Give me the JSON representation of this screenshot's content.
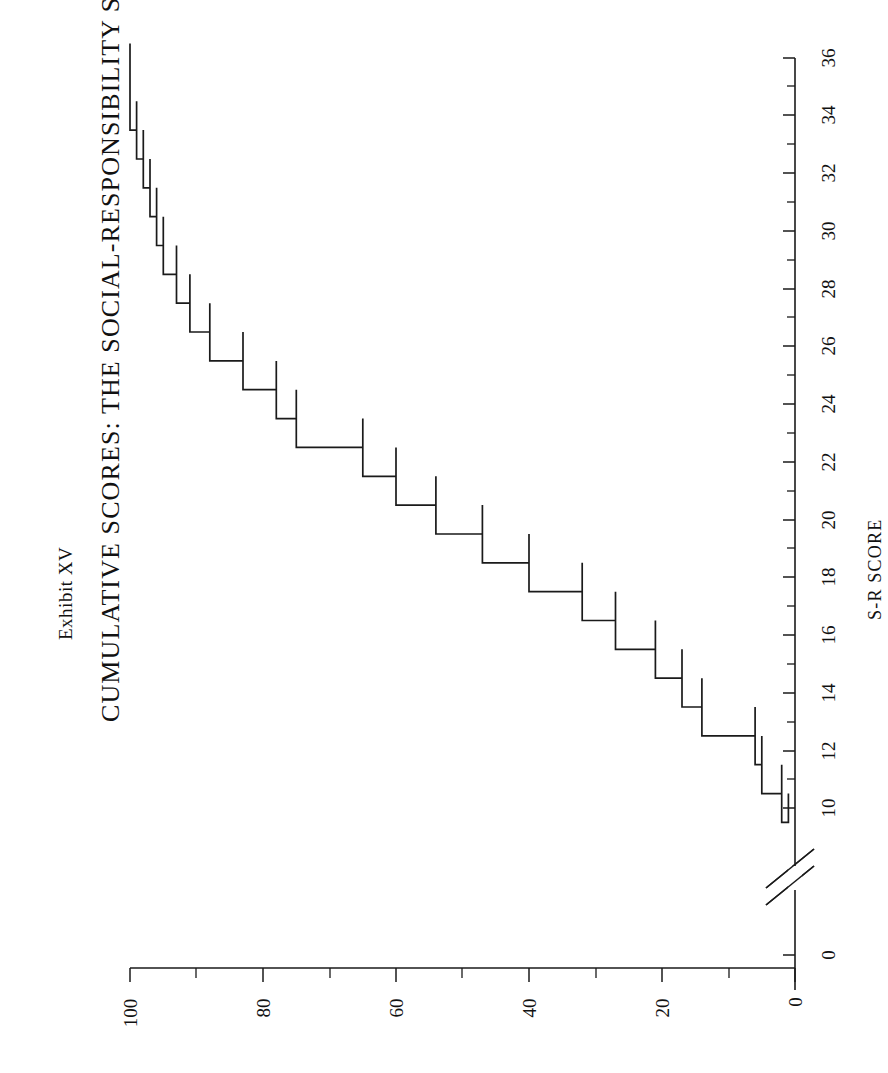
{
  "figure": {
    "exhibit_label": "Exhibit XV",
    "title": "CUMULATIVE SCORES:  THE SOCIAL-RESPONSIBILITY SCALE",
    "orientation": "rotated-90-ccw",
    "background_color": "#ffffff",
    "ink_color": "#1a1a1a"
  },
  "chart_data": {
    "type": "line",
    "subtype": "cumulative-step",
    "title": "CUMULATIVE SCORES:  THE SOCIAL-RESPONSIBILITY SCALE",
    "subtitle": "Exhibit XV",
    "xlabel": "S-R SCORE",
    "ylabel": "",
    "x": [
      10,
      11,
      12,
      13,
      14,
      15,
      16,
      17,
      18,
      19,
      20,
      21,
      22,
      23,
      24,
      25,
      26,
      27,
      28,
      29,
      30,
      31,
      32,
      33,
      34,
      35,
      36
    ],
    "values": [
      1,
      2,
      5,
      6,
      14,
      17,
      21,
      27,
      32,
      40,
      47,
      54,
      60,
      65,
      75,
      78,
      83,
      88,
      91,
      93,
      95,
      96,
      97,
      98,
      99,
      100,
      100
    ],
    "xlim": [
      10,
      36
    ],
    "ylim": [
      0,
      100
    ],
    "xticks": [
      10,
      12,
      14,
      16,
      18,
      20,
      22,
      24,
      26,
      28,
      30,
      32,
      34,
      36
    ],
    "xticklabels": [
      "10",
      "12",
      "14",
      "16",
      "18",
      "20",
      "22",
      "24",
      "26",
      "28",
      "30",
      "32",
      "34",
      "36"
    ],
    "xtick_minor": [
      11,
      13,
      15,
      17,
      19,
      21,
      23,
      25,
      27,
      29,
      31,
      33,
      35
    ],
    "yticks": [
      0,
      20,
      40,
      60,
      80,
      100
    ],
    "yticklabels": [
      "0",
      "20",
      "40",
      "60",
      "80",
      "100"
    ],
    "ytick_minor": [
      10,
      30,
      50,
      70,
      90
    ],
    "axis_break": {
      "axis": "x",
      "between": [
        0,
        10
      ],
      "label_before_break": "0"
    },
    "grid": false,
    "legend": null,
    "series_color": "#1a1a1a",
    "line_width": 1.7
  },
  "axes": {
    "x_axis": {
      "name": "S-R SCORE",
      "title": "S-R SCORE",
      "tick_labels": [
        "0",
        "10",
        "12",
        "14",
        "16",
        "18",
        "20",
        "22",
        "24",
        "26",
        "28",
        "30",
        "32",
        "34",
        "36"
      ]
    },
    "y_axis": {
      "name": "cumulative-percent",
      "title": "",
      "tick_labels": [
        "0",
        "20",
        "40",
        "60",
        "80",
        "100"
      ]
    }
  }
}
